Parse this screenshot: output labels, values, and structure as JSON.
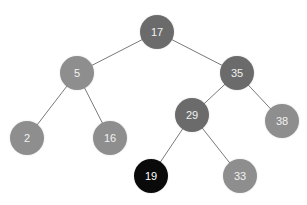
{
  "diagram": {
    "type": "binary-search-tree",
    "colors": {
      "dark": "#6b6b6b",
      "medium": "#8e8e8e",
      "black": "#0a0a0a",
      "edge": "#7a7a7a",
      "label": "#f2f2f2"
    },
    "nodes": [
      {
        "id": "n17",
        "label": "17",
        "x": 157,
        "y": 32,
        "style": "dark"
      },
      {
        "id": "n5",
        "label": "5",
        "x": 77,
        "y": 73,
        "style": "medium"
      },
      {
        "id": "n35",
        "label": "35",
        "x": 237,
        "y": 73,
        "style": "dark"
      },
      {
        "id": "n2",
        "label": "2",
        "x": 27,
        "y": 138,
        "style": "medium"
      },
      {
        "id": "n16",
        "label": "16",
        "x": 110,
        "y": 138,
        "style": "medium"
      },
      {
        "id": "n29",
        "label": "29",
        "x": 192,
        "y": 115,
        "style": "dark"
      },
      {
        "id": "n38",
        "label": "38",
        "x": 282,
        "y": 121,
        "style": "medium"
      },
      {
        "id": "n19",
        "label": "19",
        "x": 151,
        "y": 176,
        "style": "black"
      },
      {
        "id": "n33",
        "label": "33",
        "x": 240,
        "y": 176,
        "style": "medium"
      }
    ],
    "edges": [
      {
        "from": "n17",
        "to": "n5"
      },
      {
        "from": "n17",
        "to": "n35"
      },
      {
        "from": "n5",
        "to": "n2"
      },
      {
        "from": "n5",
        "to": "n16"
      },
      {
        "from": "n35",
        "to": "n29"
      },
      {
        "from": "n35",
        "to": "n38"
      },
      {
        "from": "n29",
        "to": "n19"
      },
      {
        "from": "n29",
        "to": "n33"
      }
    ]
  }
}
